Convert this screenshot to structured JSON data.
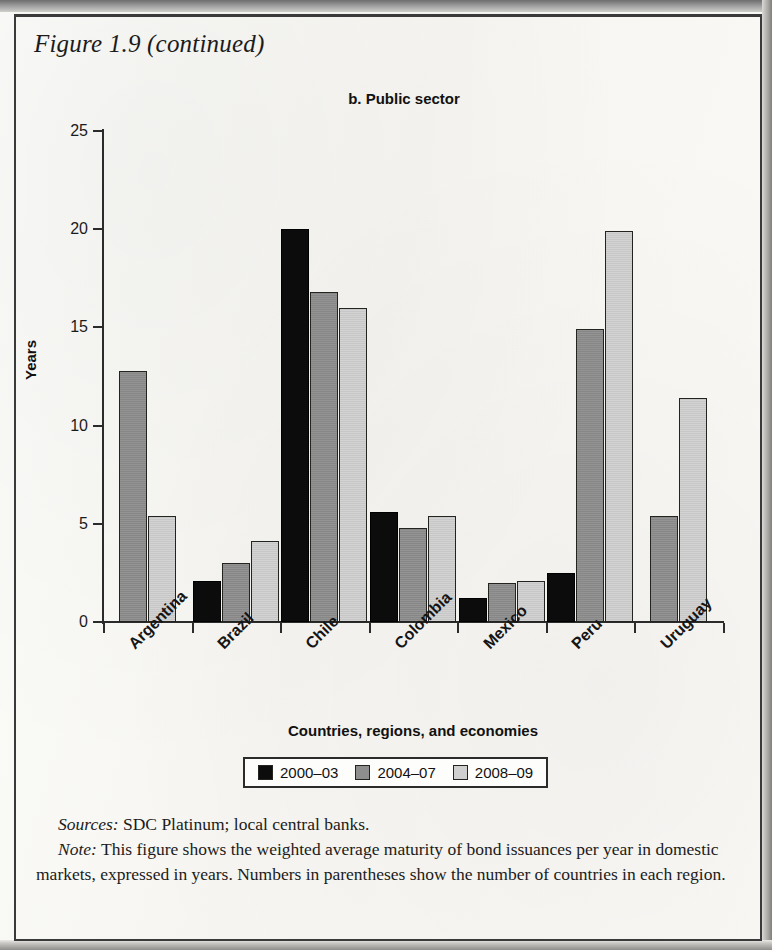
{
  "figure": {
    "title": "Figure 1.9 (continued)",
    "sources_label": "Sources:",
    "sources_text": "SDC Platinum; local central banks.",
    "note_label": "Note:",
    "note_text": "This figure shows the weighted average maturity of bond issuances per year in domestic markets, expressed in years. Numbers in parentheses show the number of countries in each region."
  },
  "colors": {
    "series_2000_03": "#0c0c0c",
    "series_2004_07": "#8e8e8e",
    "series_2008_09": "#cfcfcf",
    "axis": "#2b2b2b",
    "page": "#fdfdfb"
  },
  "chart_data": {
    "type": "bar",
    "title": "b. Public sector",
    "xlabel": "Countries, regions, and economies",
    "ylabel": "Years",
    "categories": [
      "Argentina",
      "Brazil",
      "Chile",
      "Colombia",
      "Mexico",
      "Peru",
      "Uruguay"
    ],
    "series": [
      {
        "name": "2000–03",
        "color": "#0c0c0c",
        "values": [
          null,
          2.1,
          20.0,
          5.6,
          1.2,
          2.5,
          null
        ]
      },
      {
        "name": "2004–07",
        "color": "#8e8e8e",
        "values": [
          12.8,
          3.0,
          16.8,
          4.8,
          2.0,
          14.9,
          5.4
        ]
      },
      {
        "name": "2008–09",
        "color": "#cfcfcf",
        "values": [
          5.4,
          4.1,
          16.0,
          5.4,
          2.1,
          19.9,
          11.4
        ]
      }
    ],
    "ylim": [
      0,
      25
    ],
    "yticks": [
      0,
      5,
      10,
      15,
      20,
      25
    ],
    "ytick_labels": [
      "0",
      "5",
      "10",
      "15",
      "20",
      "25"
    ],
    "grid": false,
    "legend_position": "bottom",
    "xtick_label_rotation": -45
  }
}
